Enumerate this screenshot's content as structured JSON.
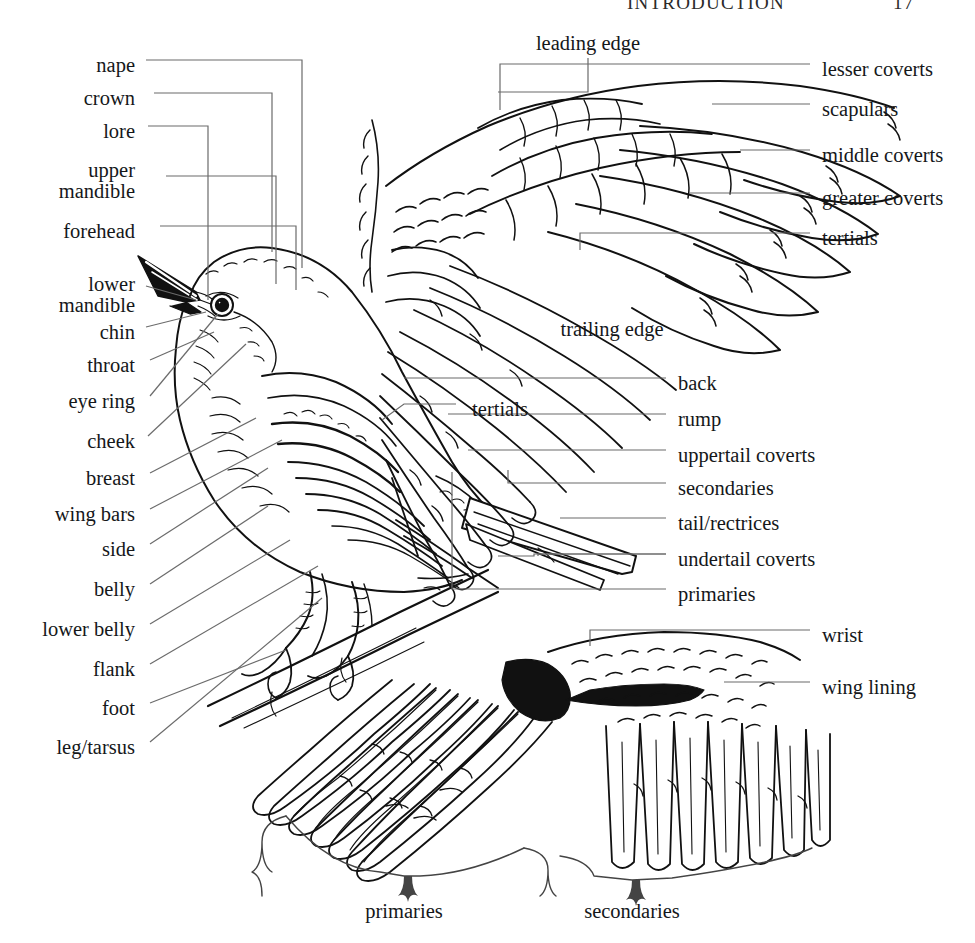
{
  "page": {
    "running_head": "INTRODUCTION",
    "page_number": "17",
    "figure_title": "Bird topography",
    "width": 975,
    "height": 943,
    "background": "#ffffff",
    "ink_color": "#111111",
    "leader_color": "#6b6b6b"
  },
  "figures": [
    {
      "name": "perched-bird",
      "caption": "perched songbird, left profile on branch"
    },
    {
      "name": "upper-wing",
      "caption": "spread wing, dorsal (upper) surface"
    },
    {
      "name": "under-wing",
      "caption": "spread wing, ventral (under) surface"
    }
  ],
  "labels": {
    "left_column": [
      {
        "id": "nape",
        "text": "nape",
        "x": 135,
        "y": 67,
        "leader": "orthogonal"
      },
      {
        "id": "crown",
        "text": "crown",
        "x": 135,
        "y": 100,
        "leader": "orthogonal"
      },
      {
        "id": "lore",
        "text": "lore",
        "x": 135,
        "y": 133,
        "leader": "orthogonal"
      },
      {
        "id": "upper-mandible",
        "text": "upper\nmandible",
        "x": 135,
        "y": 177,
        "leader": "orthogonal",
        "lines": [
          "upper",
          "mandible"
        ]
      },
      {
        "id": "forehead",
        "text": "forehead",
        "x": 135,
        "y": 233,
        "leader": "orthogonal"
      },
      {
        "id": "lower-mandible",
        "text": "lower\nmandible",
        "x": 135,
        "y": 291,
        "leader": "straight",
        "lines": [
          "lower",
          "mandible"
        ]
      },
      {
        "id": "chin",
        "text": "chin",
        "x": 135,
        "y": 333,
        "leader": "straight"
      },
      {
        "id": "throat",
        "text": "throat",
        "x": 135,
        "y": 366,
        "leader": "straight"
      },
      {
        "id": "eye-ring",
        "text": "eye ring",
        "x": 135,
        "y": 402,
        "leader": "straight"
      },
      {
        "id": "cheek",
        "text": "cheek",
        "x": 135,
        "y": 442,
        "leader": "straight"
      },
      {
        "id": "breast",
        "text": "breast",
        "x": 135,
        "y": 479,
        "leader": "straight"
      },
      {
        "id": "wing-bars",
        "text": "wing bars",
        "x": 135,
        "y": 515,
        "leader": "straight"
      },
      {
        "id": "side",
        "text": "side",
        "x": 135,
        "y": 550,
        "leader": "straight"
      },
      {
        "id": "belly",
        "text": "belly",
        "x": 135,
        "y": 590,
        "leader": "straight"
      },
      {
        "id": "lower-belly",
        "text": "lower belly",
        "x": 135,
        "y": 630,
        "leader": "straight"
      },
      {
        "id": "flank",
        "text": "flank",
        "x": 135,
        "y": 670,
        "leader": "straight"
      },
      {
        "id": "foot",
        "text": "foot",
        "x": 135,
        "y": 709,
        "leader": "straight"
      },
      {
        "id": "leg-tarsus",
        "text": "leg/tarsus",
        "x": 135,
        "y": 748,
        "leader": "straight"
      }
    ],
    "upper_wing_right": [
      {
        "id": "lesser-coverts",
        "text": "lesser coverts",
        "x": 822,
        "y": 70
      },
      {
        "id": "scapulars",
        "text": "scapulars",
        "x": 822,
        "y": 110
      },
      {
        "id": "middle-coverts",
        "text": "middle coverts",
        "x": 822,
        "y": 156
      },
      {
        "id": "greater-coverts",
        "text": "greater coverts",
        "x": 822,
        "y": 199
      },
      {
        "id": "tertials-wing",
        "text": "tertials",
        "x": 822,
        "y": 239
      }
    ],
    "body_right": [
      {
        "id": "back",
        "text": "back",
        "x": 678,
        "y": 384
      },
      {
        "id": "rump",
        "text": "rump",
        "x": 678,
        "y": 420
      },
      {
        "id": "uppertail-coverts",
        "text": "uppertail coverts",
        "x": 678,
        "y": 456
      },
      {
        "id": "secondaries-body",
        "text": "secondaries",
        "x": 678,
        "y": 489
      },
      {
        "id": "tail-rectrices",
        "text": "tail/rectrices",
        "x": 678,
        "y": 524
      },
      {
        "id": "undertail-coverts",
        "text": "undertail coverts",
        "x": 678,
        "y": 560
      },
      {
        "id": "primaries-body",
        "text": "primaries",
        "x": 678,
        "y": 595
      }
    ],
    "under_wing_right": [
      {
        "id": "wrist",
        "text": "wrist",
        "x": 822,
        "y": 636
      },
      {
        "id": "wing-lining",
        "text": "wing lining",
        "x": 822,
        "y": 688
      }
    ],
    "free": [
      {
        "id": "leading-edge",
        "text": "leading edge",
        "x": 588,
        "y": 42,
        "align": "center"
      },
      {
        "id": "trailing-edge",
        "text": "trailing edge",
        "x": 612,
        "y": 328,
        "align": "center"
      },
      {
        "id": "tertials-body",
        "text": "tertials",
        "x": 500,
        "y": 410,
        "align": "center"
      }
    ],
    "brackets": [
      {
        "id": "primaries-brace",
        "text": "primaries",
        "x": 404,
        "y": 912,
        "align": "center"
      },
      {
        "id": "secondaries-brace",
        "text": "secondaries",
        "x": 632,
        "y": 912,
        "align": "center"
      }
    ]
  }
}
